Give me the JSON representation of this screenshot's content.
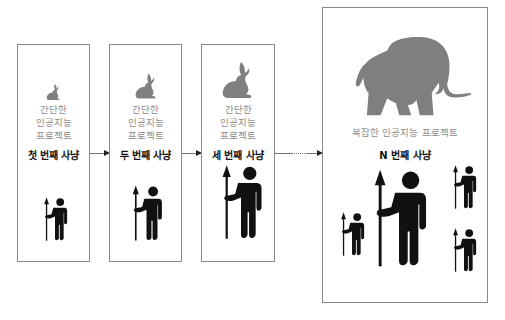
{
  "colors": {
    "animal_fill": "#7f7f7f",
    "hunter_fill": "#111111",
    "project_text": "#8c8c8c",
    "label_text": "#111111",
    "border": "#8a8a8a"
  },
  "stages": [
    {
      "animal": "rabbit-small",
      "project_lines": [
        "간단한",
        "인공지능",
        "프로젝트"
      ],
      "hunt_label": "첫 번째 사냥",
      "hunters": 1
    },
    {
      "animal": "rabbit-medium",
      "project_lines": [
        "간단한",
        "인공지능",
        "프로젝트"
      ],
      "hunt_label": "두 번째 사냥",
      "hunters": 1
    },
    {
      "animal": "rabbit-large",
      "project_lines": [
        "간단한",
        "인공지능",
        "프로젝트"
      ],
      "hunt_label": "세 번째 사냥",
      "hunters": 1
    },
    {
      "animal": "elephant",
      "project_lines": [
        "복잡한 인공지능 프로젝트"
      ],
      "hunt_label": "N 번째 사냥",
      "hunters": 4
    }
  ],
  "connectors": [
    {
      "from": 0,
      "to": 1,
      "style": "solid"
    },
    {
      "from": 1,
      "to": 2,
      "style": "solid"
    },
    {
      "from": 2,
      "to": 3,
      "style": "dotted"
    }
  ]
}
